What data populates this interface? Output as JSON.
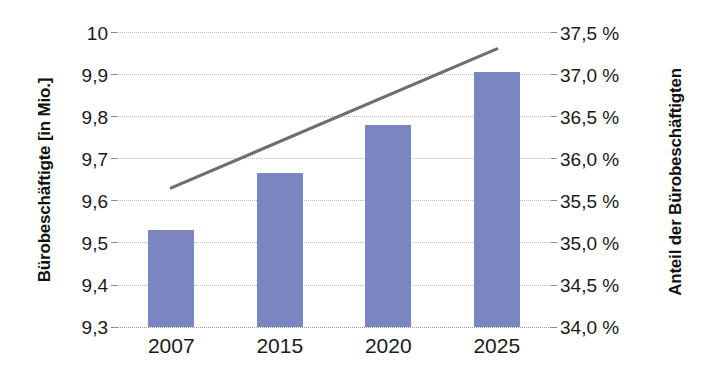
{
  "chart_data": {
    "type": "bar",
    "title": "",
    "subtitle": "",
    "categories": [
      "2007",
      "2015",
      "2020",
      "2025"
    ],
    "series": [
      {
        "name": "Bürobeschäftigte [in Mio.]",
        "type": "bar",
        "axis": "left",
        "values": [
          9.53,
          9.665,
          9.78,
          9.905
        ],
        "color": "#7b85c0"
      },
      {
        "name": "Anteil der Bürobeschäftigten",
        "type": "line",
        "axis": "right",
        "values": [
          35.65,
          null,
          null,
          37.3
        ],
        "color": "#6e6e6e"
      }
    ],
    "xlabel": "",
    "ylabel": "Bürobeschäftigte [in Mio.]",
    "y2label": "Anteil der Bürobeschäftigten",
    "ylim": [
      9.3,
      10.0
    ],
    "y2lim": [
      34.0,
      37.5
    ],
    "grid": true,
    "legend": "none",
    "y_ticks": [
      "9,3",
      "9,4",
      "9,5",
      "9,6",
      "9,7",
      "9,8",
      "9,9",
      "10"
    ],
    "y_tick_values": [
      9.3,
      9.4,
      9.5,
      9.6,
      9.7,
      9.8,
      9.9,
      10.0
    ],
    "y2_ticks": [
      "34,0 %",
      "34,5 %",
      "35,0 %",
      "35,5 %",
      "36,0 %",
      "36,5 %",
      "37,0 %",
      "37,5 %"
    ],
    "y2_tick_values": [
      34.0,
      34.5,
      35.0,
      35.5,
      36.0,
      36.5,
      37.0,
      37.5
    ]
  },
  "axes": {
    "left": {
      "title": "Bürobeschäftigte [in Mio.]",
      "ticks": [
        "10",
        "9,9",
        "9,8",
        "9,7",
        "9,6",
        "9,5",
        "9,4",
        "9,3"
      ]
    },
    "right": {
      "title": "Anteil der Bürobeschäftigten",
      "ticks": [
        "37,5 %",
        "37,0 %",
        "36,5 %",
        "36,0 %",
        "35,5 %",
        "35,0 %",
        "34,5 %",
        "34,0 %"
      ]
    },
    "bottom": {
      "ticks": [
        "2007",
        "2015",
        "2020",
        "2025"
      ]
    }
  }
}
